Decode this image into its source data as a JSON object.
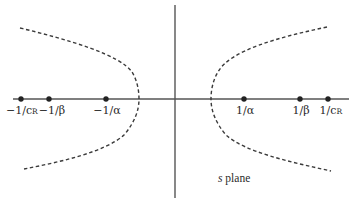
{
  "diagram": {
    "plane_label": {
      "var": "s",
      "text": "plane"
    },
    "colors": {
      "axis": "#555555",
      "curve": "#3a3a3a",
      "dot": "#222222",
      "text": "#2a2a2a",
      "background": "#ffffff"
    },
    "real_axis_points": [
      {
        "id": "neg-1-over-cR",
        "label_main": "−1/c",
        "label_sub": "R",
        "x": 21
      },
      {
        "id": "neg-1-over-beta",
        "label_main": "−1/β",
        "label_sub": "",
        "x": 49
      },
      {
        "id": "neg-1-over-alpha",
        "label_main": "−1/α",
        "label_sub": "",
        "x": 106
      },
      {
        "id": "pos-1-over-alpha",
        "label_main": "1/α",
        "label_sub": "",
        "x": 244
      },
      {
        "id": "pos-1-over-beta",
        "label_main": "1/β",
        "label_sub": "",
        "x": 300
      },
      {
        "id": "pos-1-over-cR",
        "label_main": "1/c",
        "label_sub": "R",
        "x": 328
      }
    ],
    "curves": [
      {
        "id": "left-hyperbola-branch",
        "style": "dashed",
        "vertex_x": 139
      },
      {
        "id": "right-hyperbola-branch",
        "style": "dashed",
        "vertex_x": 211
      }
    ]
  }
}
